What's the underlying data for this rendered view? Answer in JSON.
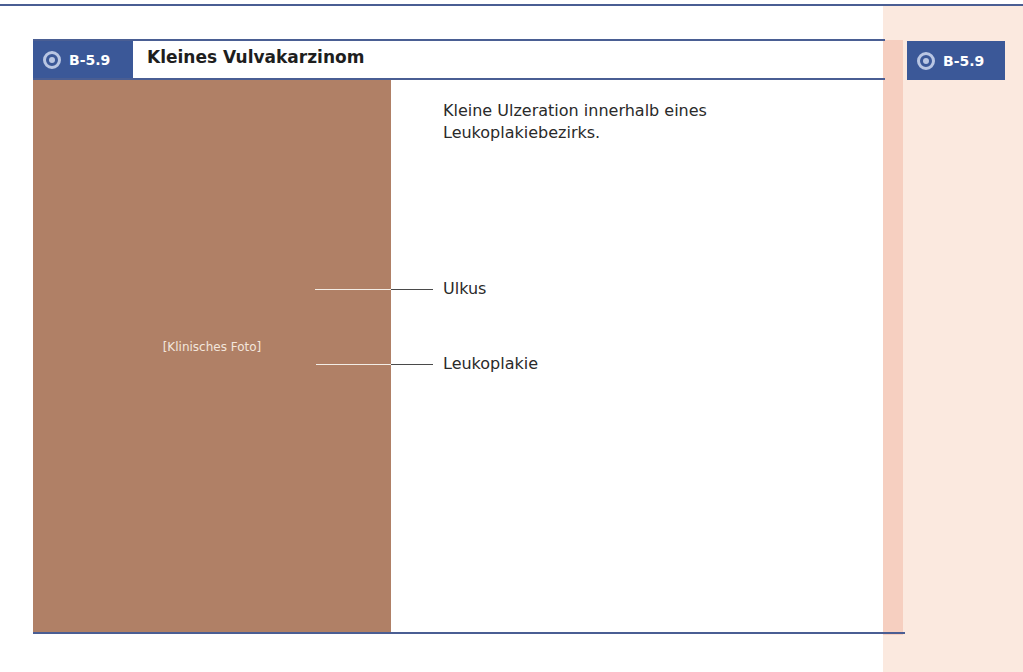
{
  "figure": {
    "number": "B-5.9",
    "title": "Kleines Vulvakarzinom",
    "caption": "Kleine Ulzeration innerhalb eines Leukoplakiebezirks.",
    "photo_placeholder": "[Klinisches Foto]",
    "labels": [
      {
        "text": "Ulkus"
      },
      {
        "text": "Leukoplakie"
      }
    ]
  },
  "margin": {
    "badge_number": "B-5.9"
  },
  "colors": {
    "accent_blue": "#3b5898",
    "rule_blue": "#4a5e93",
    "margin_bg": "#fbe9df"
  }
}
